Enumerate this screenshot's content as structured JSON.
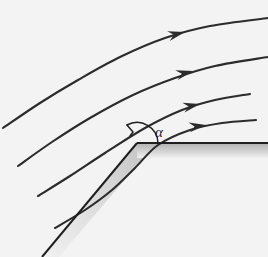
{
  "figure": {
    "name": "supersonic-expansion-corner-streamlines",
    "background_color": "#f3f3f3",
    "width": 268,
    "height": 257
  },
  "labels": {
    "angle_symbol": "α"
  },
  "colors": {
    "streamline": "#2b2b2b",
    "wall": "#1e1e1e",
    "solid_shading_dark": "#b9b9b9",
    "solid_shading_light": "#e2e2e2",
    "background": "#f3f3f3",
    "label": "#1e1e1e"
  },
  "geometry": {
    "corner_vertex": {
      "x": 137,
      "y": 143
    },
    "horizontal_wall_end": {
      "x": 268,
      "y": 143
    },
    "inclined_wall_end": {
      "x": 42,
      "y": 257
    },
    "angle_arc_radius": 22,
    "angle_label_position": {
      "x": 155,
      "y": 137
    }
  },
  "chart_data": {
    "type": "line",
    "xlabel": "",
    "ylabel": "",
    "grid": false,
    "legend": "none",
    "xlim": [
      0,
      268
    ],
    "ylim": [
      0,
      257
    ],
    "annotations": [
      {
        "text": "α",
        "x": 155,
        "y": 137,
        "kind": "angle-label"
      }
    ],
    "series": [
      {
        "name": "streamline-1",
        "points": [
          [
            3,
            128
          ],
          [
            40,
            103
          ],
          [
            78,
            80
          ],
          [
            120,
            57
          ],
          [
            165,
            38
          ],
          [
            210,
            26
          ],
          [
            268,
            18
          ]
        ],
        "arrow_at": [
          185,
          32
        ],
        "arrow_angle_deg": -14
      },
      {
        "name": "streamline-2",
        "points": [
          [
            18,
            166
          ],
          [
            52,
            142
          ],
          [
            90,
            118
          ],
          [
            133,
            95
          ],
          [
            175,
            78
          ],
          [
            215,
            66
          ],
          [
            268,
            57
          ]
        ],
        "arrow_at": [
          193,
          71
        ],
        "arrow_angle_deg": -14
      },
      {
        "name": "streamline-3",
        "points": [
          [
            38,
            196
          ],
          [
            70,
            176
          ],
          [
            105,
            153
          ],
          [
            145,
            128
          ],
          [
            182,
            110
          ],
          [
            215,
            100
          ],
          [
            250,
            94
          ]
        ],
        "arrow_at": [
          200,
          104
        ],
        "arrow_angle_deg": -12
      },
      {
        "name": "streamline-4",
        "points": [
          [
            55,
            228
          ],
          [
            85,
            210
          ],
          [
            112,
            190
          ],
          [
            135,
            168
          ],
          [
            158,
            145
          ],
          [
            190,
            130
          ],
          [
            222,
            123
          ],
          [
            256,
            120
          ]
        ],
        "arrow_at": [
          206,
          125
        ],
        "arrow_angle_deg": -8
      }
    ],
    "walls": [
      {
        "name": "horizontal-wall",
        "points": [
          [
            137,
            143
          ],
          [
            268,
            143
          ]
        ],
        "shaded_below": true,
        "shade_thickness": 13
      },
      {
        "name": "inclined-wall",
        "points": [
          [
            137,
            143
          ],
          [
            42,
            257
          ]
        ],
        "shaded_below": true,
        "shade_thickness": 13
      }
    ]
  }
}
